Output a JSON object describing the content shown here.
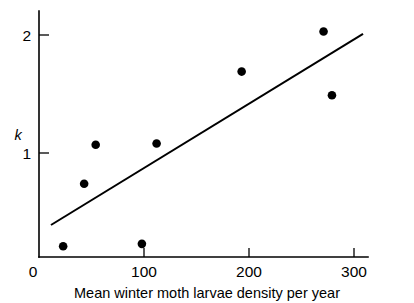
{
  "chart_data": {
    "type": "scatter",
    "title": "",
    "subtitle": "",
    "xlabel": "Mean winter moth larvae density per year",
    "ylabel": "k",
    "xlim": [
      0,
      313
    ],
    "ylim": [
      0,
      2.21
    ],
    "xticks": [
      0,
      100,
      200,
      300
    ],
    "xticklabels": [
      "0",
      "100",
      "200",
      "300"
    ],
    "yticks": [
      1,
      2
    ],
    "yticklabels": [
      "1",
      "2"
    ],
    "grid": false,
    "legend": null,
    "series": [
      {
        "name": "observations",
        "marker": "filled-circle",
        "color": "#000000",
        "points": [
          {
            "x": 23,
            "y": 0.21
          },
          {
            "x": 43,
            "y": 0.74
          },
          {
            "x": 54,
            "y": 1.07
          },
          {
            "x": 98,
            "y": 0.23
          },
          {
            "x": 112,
            "y": 1.08
          },
          {
            "x": 193,
            "y": 1.69
          },
          {
            "x": 271,
            "y": 2.03
          },
          {
            "x": 279,
            "y": 1.49
          }
        ]
      },
      {
        "name": "regression-line",
        "type": "line",
        "color": "#000000",
        "points": [
          {
            "x": 11.4,
            "y": 0.39
          },
          {
            "x": 308.6,
            "y": 2.01
          }
        ]
      }
    ],
    "annotations": []
  },
  "figure": {
    "background_color": "#ffffff",
    "foreground_color": "#000000"
  }
}
